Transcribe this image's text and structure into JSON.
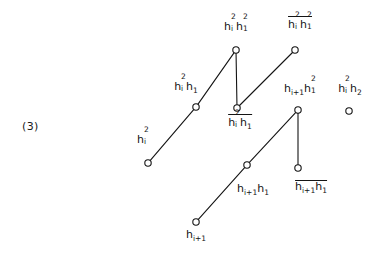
{
  "figure": {
    "number": "(3)",
    "type": "hasse-lattice-diagram"
  },
  "nodes": [
    {
      "id": "hi2h12",
      "label": "h_i^2 h_1^2",
      "label_plain": "hi2h12",
      "overbar": false,
      "x": 236,
      "y": 50,
      "label_x": 236,
      "label_y": 18
    },
    {
      "id": "hi2h12-bar",
      "label": "h_i^2 h_1^2 (overbar)",
      "label_plain": "hi2h12",
      "overbar": true,
      "x": 295,
      "y": 50,
      "label_x": 300,
      "label_y": 16
    },
    {
      "id": "hi2h1",
      "label": "h_i^2 h_1",
      "label_plain": "hi2h1",
      "overbar": false,
      "x": 196,
      "y": 107,
      "label_x": 186,
      "label_y": 78
    },
    {
      "id": "hi2h1-bar",
      "label": "h_i^2 h_1 (overbar)",
      "label_plain": "hi2h1",
      "overbar": true,
      "x": 237,
      "y": 108,
      "label_x": 240,
      "label_y": 114
    },
    {
      "id": "hi1h12",
      "label": "h_{i+1} h_1^2",
      "label_plain": "hi+1h12",
      "overbar": false,
      "x": 298,
      "y": 110,
      "label_x": 300,
      "label_y": 80
    },
    {
      "id": "hi2h2",
      "label": "h_i^2 h_2",
      "label_plain": "hi2h2",
      "overbar": false,
      "x": 349,
      "y": 111,
      "label_x": 350,
      "label_y": 80
    },
    {
      "id": "hi2",
      "label": "h_i^2",
      "label_plain": "hi2",
      "overbar": false,
      "x": 148,
      "y": 163,
      "label_x": 143,
      "label_y": 131
    },
    {
      "id": "hi1h1",
      "label": "h_{i+1} h_1",
      "label_plain": "hi+1h1",
      "overbar": false,
      "x": 247,
      "y": 165,
      "label_x": 253,
      "label_y": 182
    },
    {
      "id": "hi1h1-bar",
      "label": "h_{i+1} h_1 (overbar)",
      "label_plain": "hi+1h1",
      "overbar": true,
      "x": 298,
      "y": 168,
      "label_x": 311,
      "label_y": 180
    },
    {
      "id": "hi1",
      "label": "h_{i+1}",
      "label_plain": "hi+1",
      "overbar": false,
      "x": 196,
      "y": 222,
      "label_x": 196,
      "label_y": 228
    }
  ],
  "edges": [
    {
      "from": "hi2",
      "to": "hi2h1",
      "kind": "diagonal"
    },
    {
      "from": "hi2h1",
      "to": "hi2h12",
      "kind": "diagonal"
    },
    {
      "from": "hi2h12",
      "to": "hi2h1-bar",
      "kind": "vertical"
    },
    {
      "from": "hi2h1-bar",
      "to": "hi2h12-bar",
      "kind": "diagonal"
    },
    {
      "from": "hi1",
      "to": "hi1h1",
      "kind": "diagonal"
    },
    {
      "from": "hi1h1",
      "to": "hi1h12",
      "kind": "diagonal"
    },
    {
      "from": "hi1h12",
      "to": "hi1h1-bar",
      "kind": "vertical"
    }
  ],
  "style": {
    "line_color": "#141414",
    "node_stroke": "#141414",
    "node_fill": "#ffffff",
    "node_radius": 3.2,
    "line_width": 1.1,
    "text_color": "#141414",
    "background": "#ffffff"
  }
}
